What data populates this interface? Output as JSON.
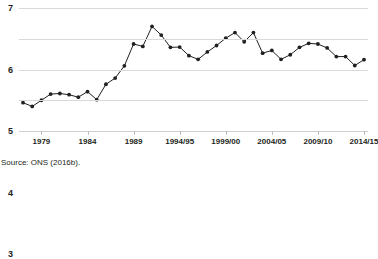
{
  "chart_data": {
    "type": "line",
    "title": "",
    "xlabel": "",
    "ylabel": "",
    "ylim": [
      3,
      7
    ],
    "yticks": [
      3,
      4,
      5,
      6,
      7
    ],
    "grid": true,
    "legend": false,
    "marker": "filled-circle",
    "line_color": "#231f20",
    "marker_color": "#231f20",
    "x": [
      "1977",
      "1978",
      "1979",
      "1980",
      "1981",
      "1982",
      "1983",
      "1984",
      "1985",
      "1986",
      "1987",
      "1988",
      "1989",
      "1990",
      "1991",
      "1992",
      "1993",
      "1994/95",
      "1995/96",
      "1996/97",
      "1997/98",
      "1998/99",
      "1999/00",
      "2000/01",
      "2001/02",
      "2002/03",
      "2003/04",
      "2004/05",
      "2005/06",
      "2006/07",
      "2007/08",
      "2008/09",
      "2009/10",
      "2010/11",
      "2011/12",
      "2012/13",
      "2013/14",
      "2014/15"
    ],
    "values": [
      3.92,
      3.8,
      4.0,
      4.2,
      4.22,
      4.18,
      4.1,
      4.28,
      4.02,
      4.52,
      4.72,
      5.12,
      5.83,
      5.75,
      6.4,
      6.12,
      5.72,
      5.73,
      5.45,
      5.33,
      5.57,
      5.78,
      6.02,
      6.2,
      5.9,
      6.2,
      5.53,
      5.62,
      5.33,
      5.48,
      5.72,
      5.85,
      5.83,
      5.7,
      5.42,
      5.42,
      5.13,
      5.32
    ],
    "xtick_labels": [
      "1979",
      "1984",
      "1989",
      "1994/95",
      "1999/00",
      "2004/05",
      "2009/10",
      "2014/15"
    ],
    "xtick_x": [
      "1979",
      "1984",
      "1989",
      "1994/95",
      "1999/00",
      "2004/05",
      "2009/10",
      "2014/15"
    ],
    "extra_points": [
      {
        "x": "2015/16",
        "y": 5.33
      }
    ]
  },
  "footer": {
    "source": "Source: ONS (2016b)."
  }
}
